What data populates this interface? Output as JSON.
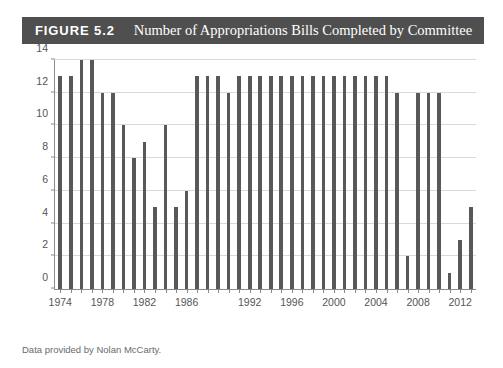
{
  "figure": {
    "number_label": "FIGURE 5.2",
    "title": "Number of Appropriations Bills Completed by Committee",
    "banner_color": "#4f4f4f",
    "banner_text_color": "#ffffff"
  },
  "source_note": "Data provided by Nolan McCarty.",
  "chart_data": {
    "type": "bar",
    "title": "Number of Appropriations Bills Completed by Committee",
    "xlabel": "",
    "ylabel": "",
    "ylim": [
      0,
      14
    ],
    "ytick_values": [
      0,
      2,
      4,
      6,
      8,
      10,
      12,
      14
    ],
    "ytick_labels": [
      "0",
      "2",
      "4",
      "6",
      "8",
      "10",
      "12",
      "14"
    ],
    "xtick_labels": [
      "1974",
      "1978",
      "1982",
      "1986",
      "1992",
      "1996",
      "2000",
      "2004",
      "2008",
      "2012"
    ],
    "xtick_categories": [
      "1974",
      "1978",
      "1982",
      "1986",
      "1992",
      "1996",
      "2000",
      "2004",
      "2008",
      "2012"
    ],
    "grid": true,
    "legend": "none",
    "bar_color": "#585858",
    "categories": [
      "1974",
      "1975",
      "1976",
      "1977",
      "1978",
      "1979",
      "1980",
      "1981",
      "1982",
      "1983",
      "1984",
      "1985",
      "1986",
      "1987",
      "1988",
      "1989",
      "1990",
      "1991",
      "1992",
      "1993",
      "1994",
      "1995",
      "1996",
      "1997",
      "1998",
      "1999",
      "2000",
      "2001",
      "2002",
      "2003",
      "2004",
      "2005",
      "2006",
      "2007",
      "2008",
      "2009",
      "2010",
      "2011",
      "2012",
      "2013"
    ],
    "values": [
      13,
      13,
      14,
      14,
      12,
      12,
      10,
      8,
      9,
      5,
      10,
      5,
      6,
      13,
      13,
      13,
      12,
      13,
      13,
      13,
      13,
      13,
      13,
      13,
      13,
      13,
      13,
      13,
      13,
      13,
      13,
      13,
      12,
      2,
      12,
      12,
      12,
      1,
      3,
      5
    ]
  }
}
